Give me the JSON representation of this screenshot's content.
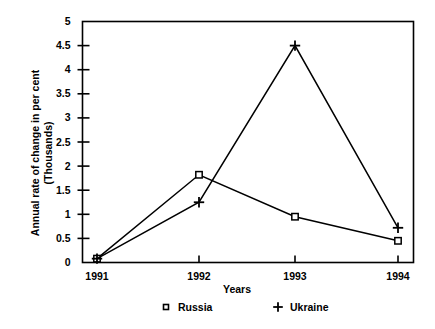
{
  "chart_data": {
    "type": "line",
    "title": "",
    "xlabel": "Years",
    "ylabel": "Annual rate of change in per cent\n(Thousands)",
    "categories": [
      "1991",
      "1992",
      "1993",
      "1994"
    ],
    "x": [
      1991,
      1992,
      1993,
      1994
    ],
    "series": [
      {
        "name": "Russia",
        "marker": "open-square",
        "values": [
          0.08,
          1.82,
          0.95,
          0.45
        ]
      },
      {
        "name": "Ukraine",
        "marker": "plus",
        "values": [
          0.08,
          1.25,
          4.5,
          0.72
        ]
      }
    ],
    "ylim": [
      0,
      5
    ],
    "yticks": [
      "0",
      "0.5",
      "1",
      "1.5",
      "2",
      "2.5",
      "3",
      "3.5",
      "4",
      "4.5",
      "5"
    ],
    "ytick_values": [
      0,
      0.5,
      1,
      1.5,
      2,
      2.5,
      3,
      3.5,
      4,
      4.5,
      5
    ],
    "xticks": [
      "1991",
      "1992",
      "1993",
      "1994"
    ],
    "grid": false,
    "legend_position": "bottom",
    "line_color": "#000000",
    "frame_color": "#000000",
    "background": "#ffffff"
  },
  "axes": {
    "y_title": "Annual rate of change in per cent\n(Thousands)",
    "x_title": "Years"
  },
  "legend": {
    "entries": [
      {
        "label": "Russia",
        "marker": "open-square-marker"
      },
      {
        "label": "Ukraine",
        "marker": "plus-marker"
      }
    ]
  }
}
